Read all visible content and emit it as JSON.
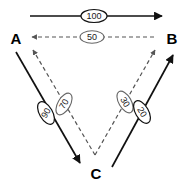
{
  "diagram": {
    "type": "directed-graph",
    "nodes": [
      {
        "id": "A",
        "label": "A"
      },
      {
        "id": "B",
        "label": "B"
      },
      {
        "id": "C",
        "label": "C"
      }
    ],
    "edges": [
      {
        "id": "a-to-b",
        "from": "A",
        "to": "B",
        "weight": "100",
        "style": "solid"
      },
      {
        "id": "b-to-a",
        "from": "B",
        "to": "A",
        "weight": "50",
        "style": "dashed"
      },
      {
        "id": "a-to-c",
        "from": "A",
        "to": "C",
        "weight": "90",
        "style": "solid"
      },
      {
        "id": "c-to-a",
        "from": "C",
        "to": "A",
        "weight": "70",
        "style": "dashed"
      },
      {
        "id": "c-to-b-dashed",
        "from": "C",
        "to": "B",
        "weight": "30",
        "style": "dashed"
      },
      {
        "id": "c-to-b-solid",
        "from": "C",
        "to": "B",
        "weight": "20",
        "style": "solid"
      }
    ],
    "colors": {
      "solid_edge": "#111111",
      "dashed_edge": "#555555",
      "node_text": "#000000",
      "background": "#ffffff"
    }
  }
}
